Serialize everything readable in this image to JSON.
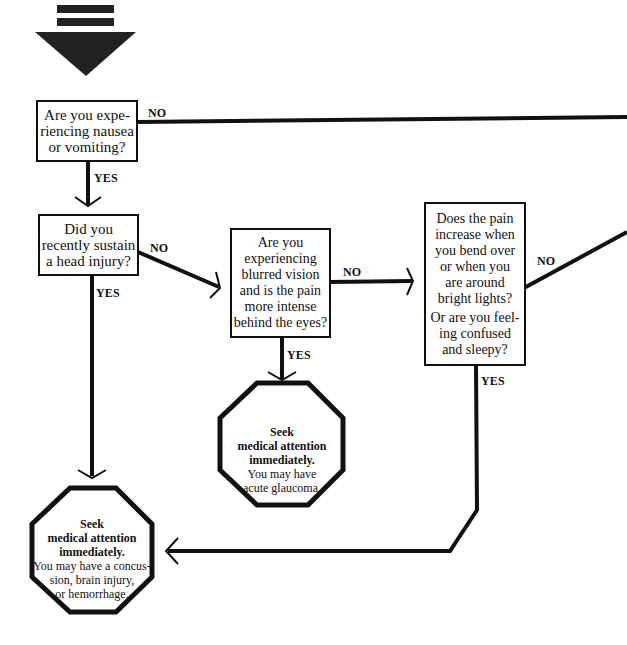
{
  "start_marker": {
    "icon": "down-arrow-start-icon"
  },
  "colors": {
    "ink": "#111111",
    "background": "#ffffff"
  },
  "nodes": {
    "q1": {
      "text": "Are you experiencing nausea or vomiting?",
      "lines": [
        "Are you expe-",
        "riencing nausea",
        "or vomiting?"
      ]
    },
    "q2": {
      "text": "Did you recently sustain a head injury?",
      "lines": [
        "Did you",
        "recently sustain",
        "a head injury?"
      ]
    },
    "q3": {
      "text": "Are you experiencing blurred vision and is the pain more intense behind the eyes?",
      "lines": [
        "Are you",
        "experiencing",
        "blurred vision",
        "and is the pain",
        "more intense",
        "behind the eyes?"
      ]
    },
    "q4": {
      "lines": [
        "Does the pain",
        "increase when",
        "you bend over",
        "or when you",
        "are around",
        "bright lights?"
      ],
      "lines2": [
        "Or are you feel-",
        "ing confused",
        "and sleepy?"
      ]
    },
    "stop_glaucoma": {
      "bold": [
        "Seek",
        "medical attention",
        "immediately."
      ],
      "normal": [
        "You may have",
        "acute glaucoma."
      ]
    },
    "stop_concussion": {
      "bold": [
        "Seek",
        "medical attention",
        "immediately."
      ],
      "normal": [
        "You may have a concus-",
        "sion, brain injury,",
        "or hemorrhage."
      ]
    }
  },
  "edges": {
    "q1_no": "NO",
    "q1_yes": "YES",
    "q2_no": "NO",
    "q2_yes": "YES",
    "q3_no": "NO",
    "q3_yes": "YES",
    "q4_no": "NO",
    "q4_yes": "YES"
  }
}
